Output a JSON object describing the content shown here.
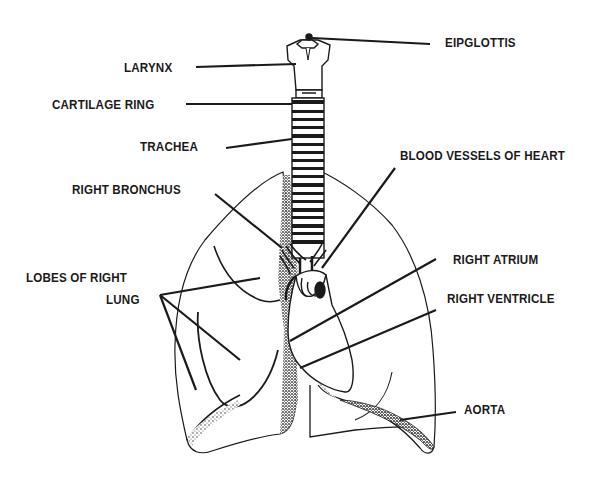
{
  "diagram": {
    "labels": {
      "epiglottis": "EIPGLOTTIS",
      "larynx": "LARYNX",
      "cartilage_ring": "CARTILAGE RING",
      "trachea": "TRACHEA",
      "right_bronchus": "RIGHT BRONCHUS",
      "blood_vessels_of_heart": "BLOOD VESSELS OF HEART",
      "lobes_of_right_lung_line1": "LOBES OF RIGHT",
      "lobes_of_right_lung_line2": "LUNG",
      "right_atrium": "RIGHT ATRIUM",
      "right_ventricle": "RIGHT VENTRICLE",
      "aorta": "AORTA"
    },
    "colors": {
      "ink": "#1a1a1a",
      "background": "#ffffff"
    }
  }
}
